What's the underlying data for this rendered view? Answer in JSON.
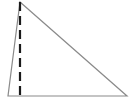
{
  "diagram": {
    "type": "triangle-with-altitude",
    "colors": {
      "background": "#ffffff",
      "triangle_stroke": "#8a8a8a",
      "altitude_stroke": "#1a1a1a"
    },
    "vertices": {
      "apex": [
        20,
        2
      ],
      "bottom_left": [
        8,
        96
      ],
      "bottom_right": [
        127,
        96
      ]
    },
    "altitude": {
      "from": [
        20,
        2
      ],
      "to": [
        20,
        96
      ],
      "style": "dashed"
    }
  }
}
